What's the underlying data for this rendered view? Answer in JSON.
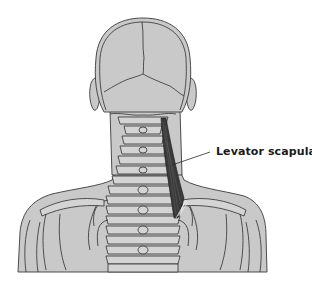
{
  "figure": {
    "highlighted_structure": "levator-scapulae-muscle",
    "colors": {
      "background": "#ffffff",
      "skin_fill": "#c9c9c9",
      "bone_fill": "#d4d4d4",
      "outline": "#2e2e2e",
      "muscle": "#3a3a3a"
    }
  },
  "labels": {
    "muscle_label": "Levator scapulae"
  }
}
